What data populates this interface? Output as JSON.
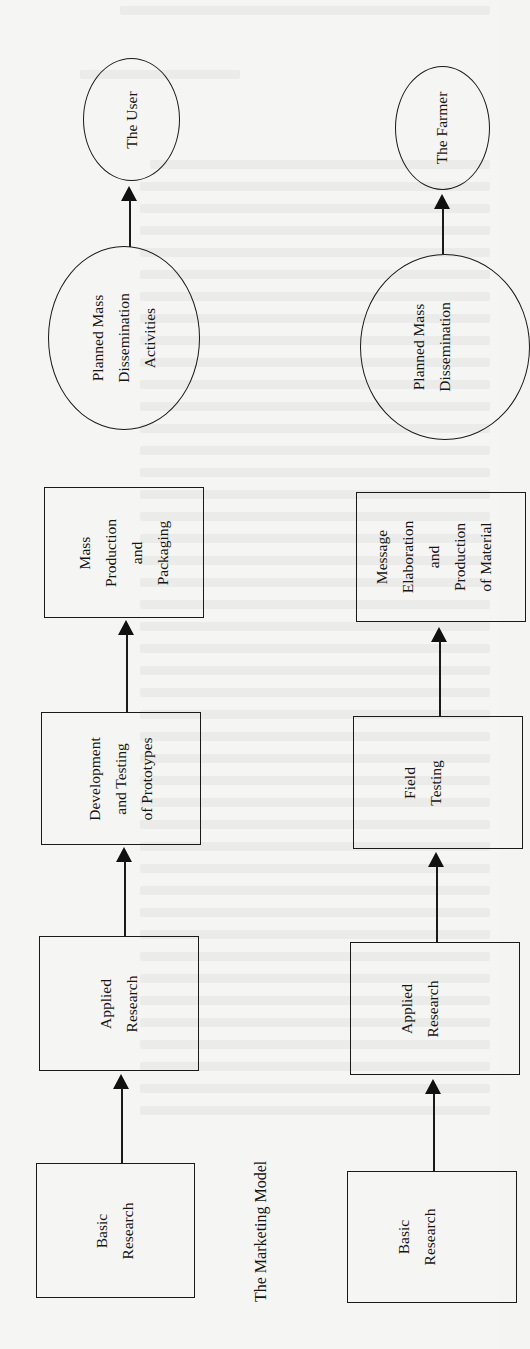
{
  "figure": {
    "caption": "The Marketing Model",
    "orientation": "rotated -90deg (reads bottom-to-top)",
    "models": [
      {
        "name": "marketing-model",
        "flow_direction": "bottom-to-top",
        "nodes": [
          {
            "id": "basic-research",
            "shape": "box",
            "label": "Basic\nResearch"
          },
          {
            "id": "applied-research",
            "shape": "box",
            "label": "Applied\nResearch"
          },
          {
            "id": "development-testing",
            "shape": "box",
            "label": "Development\nand Testing\nof Prototypes"
          },
          {
            "id": "mass-production",
            "shape": "box",
            "label": "Mass\nProduction\nand\nPackaging"
          },
          {
            "id": "planned-mass-dissemination",
            "shape": "ellipse",
            "label": "Planned Mass\nDissemination\nActivities"
          },
          {
            "id": "the-user",
            "shape": "ellipse",
            "label": "The User"
          }
        ]
      },
      {
        "name": "agricultural-model",
        "flow_direction": "bottom-to-top",
        "nodes": [
          {
            "id": "basic-research",
            "shape": "box",
            "label": "Basic\nResearch"
          },
          {
            "id": "applied-research",
            "shape": "box",
            "label": "Applied\nResearch"
          },
          {
            "id": "field-testing",
            "shape": "box",
            "label": "Field\nTesting"
          },
          {
            "id": "message-elaboration",
            "shape": "box",
            "label": "Message\nElaboration\nand\nProduction\nof Material"
          },
          {
            "id": "planned-mass-dissemination",
            "shape": "ellipse",
            "label": "Planned Mass\nDissemination"
          },
          {
            "id": "the-farmer",
            "shape": "ellipse",
            "label": "The Farmer"
          }
        ]
      }
    ]
  },
  "labels": {
    "left": {
      "the_user": "The User",
      "dissemination": "Planned Mass\nDissemination\nActivities",
      "mass_production": "Mass\nProduction\nand\nPackaging",
      "development": "Development\nand Testing\nof Prototypes",
      "applied": "Applied\nResearch",
      "basic": "Basic\nResearch"
    },
    "right": {
      "the_farmer": "The Farmer",
      "dissemination": "Planned Mass\nDissemination",
      "message": "Message\nElaboration\nand\nProduction\nof Material",
      "field": "Field\nTesting",
      "applied": "Applied\nResearch",
      "basic": "Basic\nResearch"
    },
    "caption": "The Marketing Model"
  },
  "colors": {
    "paper": "#f5f5f3",
    "ink": "#1a1a1a"
  }
}
